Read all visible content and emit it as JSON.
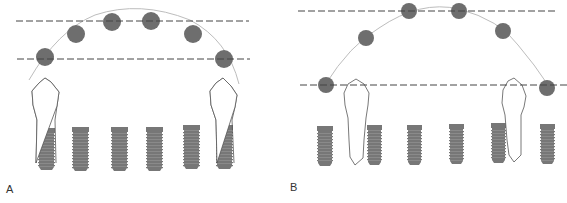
{
  "figure": {
    "panels": [
      {
        "id": "A",
        "label": "A",
        "dashed_lines": [
          {
            "x1": 16,
            "x2": 249,
            "y": 21
          },
          {
            "x1": 17,
            "x2": 250,
            "y": 59
          }
        ],
        "arch": {
          "path": "M 29 80 Q 58 30 95 15 Q 140 0 190 20 Q 228 40 239 84"
        },
        "circles": [
          {
            "cx": 45,
            "cy": 57,
            "r": 9
          },
          {
            "cx": 76,
            "cy": 34,
            "r": 9
          },
          {
            "cx": 112,
            "cy": 22,
            "r": 9
          },
          {
            "cx": 151,
            "cy": 21,
            "r": 9
          },
          {
            "cx": 193,
            "cy": 34,
            "r": 9
          },
          {
            "cx": 224,
            "cy": 59,
            "r": 9
          }
        ],
        "implants": [
          {
            "x": 38,
            "y": 128,
            "w": 17,
            "h": 42
          },
          {
            "x": 72,
            "y": 127,
            "w": 17,
            "h": 44
          },
          {
            "x": 111,
            "y": 127,
            "w": 17,
            "h": 44
          },
          {
            "x": 146,
            "y": 127,
            "w": 17,
            "h": 44
          },
          {
            "x": 183,
            "y": 125,
            "w": 17,
            "h": 44
          },
          {
            "x": 216,
            "y": 125,
            "w": 17,
            "h": 44
          }
        ],
        "teeth": [
          {
            "path": "M 36 163 L 37 120 L 33 105 L 32 91 L 39 83 L 45 78 L 51 82 L 59 92 L 57 106 L 55 120 L 56 163",
            "neck_y": 120
          },
          {
            "path": "M 217 163 L 216 120 L 211 105 L 210 91 L 216 83 L 223 78 L 231 86 L 237 95 L 235 107 L 232 120 L 234 163",
            "neck_y": 119
          }
        ]
      },
      {
        "id": "B",
        "label": "B",
        "dashed_lines": [
          {
            "x1": 298,
            "x2": 557,
            "y": 11
          },
          {
            "x1": 300,
            "x2": 567,
            "y": 85
          }
        ],
        "arch": {
          "path": "M 325 85 Q 350 45 379 28 Q 420 0 459 9 Q 500 20 518 45 Q 535 65 548 85"
        },
        "circles": [
          {
            "cx": 326,
            "cy": 85,
            "r": 8
          },
          {
            "cx": 366,
            "cy": 38,
            "r": 8
          },
          {
            "cx": 409,
            "cy": 11,
            "r": 8
          },
          {
            "cx": 459,
            "cy": 11,
            "r": 8
          },
          {
            "cx": 503,
            "cy": 31,
            "r": 8
          },
          {
            "cx": 547,
            "cy": 88,
            "r": 8
          }
        ],
        "implants": [
          {
            "x": 317,
            "y": 126,
            "w": 16,
            "h": 40
          },
          {
            "x": 367,
            "y": 125,
            "w": 15,
            "h": 40
          },
          {
            "x": 407,
            "y": 125,
            "w": 15,
            "h": 40
          },
          {
            "x": 449,
            "y": 124,
            "w": 15,
            "h": 40
          },
          {
            "x": 491,
            "y": 123,
            "w": 15,
            "h": 40
          },
          {
            "x": 540,
            "y": 124,
            "w": 15,
            "h": 40
          }
        ],
        "teeth": [
          {
            "path": "M 348 118 L 345 105 L 344 93 L 348 84 L 356 79 L 364 84 L 369 93 L 368 105 L 366 118 L 364 140 L 363 158 L 355 165 L 350 157 L 349 140 Z",
            "neck_y": 118
          },
          {
            "path": "M 505 115 L 502 103 L 503 90 L 508 81 L 514 78 L 522 85 L 526 96 L 524 107 L 521 115 L 521 140 L 521 155 L 514 162 L 509 155 L 507 140 Z",
            "neck_y": 115
          }
        ]
      }
    ],
    "colors": {
      "implant": "#777777",
      "circle": "#6e6e6e",
      "dashed_line": "#444444",
      "arch": "#bdbdbd",
      "tooth_outline": "#555555",
      "background": "#ffffff"
    }
  }
}
